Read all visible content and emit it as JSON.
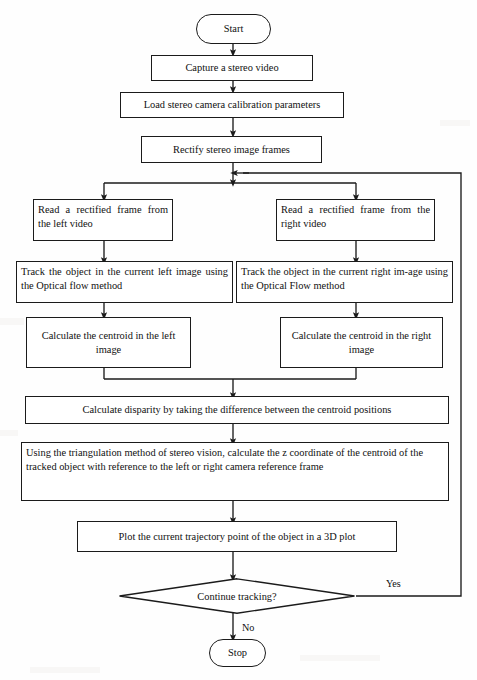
{
  "diagram": {
    "type": "flowchart",
    "stroke_color": "#1b1b1b",
    "fill_color": "#ffffff",
    "text_color": "#111111"
  },
  "nodes": {
    "start": {
      "label": "Start",
      "shape": "terminator"
    },
    "capture": {
      "label": "Capture a stereo video",
      "shape": "process"
    },
    "load_calibration": {
      "label": "Load stereo camera calibration parameters",
      "shape": "process"
    },
    "rectify": {
      "label": "Rectify stereo image frames",
      "shape": "process"
    },
    "read_left": {
      "label": "Read a rectified frame from the left video",
      "shape": "process"
    },
    "read_right": {
      "label": "Read a rectified frame from the right video",
      "shape": "process"
    },
    "track_left": {
      "label": "Track the object in the current left image using the Optical flow method",
      "shape": "process"
    },
    "track_right": {
      "label": "Track the object in the current right im-age using the Optical Flow method",
      "shape": "process"
    },
    "centroid_left": {
      "label": "Calculate the centroid in the left image",
      "shape": "process"
    },
    "centroid_right": {
      "label": "Calculate the centroid in the right image",
      "shape": "process"
    },
    "disparity": {
      "label": "Calculate disparity by taking the difference between the centroid positions",
      "shape": "process"
    },
    "triangulation": {
      "label": "Using the triangulation method of stereo vision, calculate the z coordinate of the centroid of the tracked object with reference to the left or right camera reference frame",
      "shape": "process"
    },
    "plot": {
      "label": "Plot the current trajectory point of the object in a 3D plot",
      "shape": "process"
    },
    "decision": {
      "label": "Continue tracking?",
      "shape": "decision"
    },
    "stop": {
      "label": "Stop",
      "shape": "terminator"
    }
  },
  "edge_labels": {
    "yes": "Yes",
    "no": "No"
  }
}
